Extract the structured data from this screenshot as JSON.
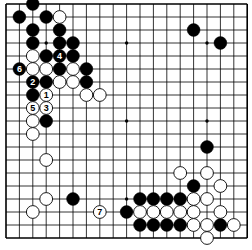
{
  "board": {
    "size": 19,
    "origin_x": 6,
    "origin_y": 4,
    "spacing_x": 13.4,
    "spacing_y": 13.0,
    "stone_radius": 6.4,
    "line_color": "#000000",
    "background": "#ffffff",
    "black_color": "#000000",
    "white_color": "#ffffff",
    "hoshi": [
      [
        3,
        3
      ],
      [
        9,
        3
      ],
      [
        15,
        3
      ],
      [
        3,
        9
      ],
      [
        9,
        9
      ],
      [
        15,
        9
      ],
      [
        3,
        15
      ],
      [
        9,
        15
      ],
      [
        15,
        15
      ]
    ]
  },
  "stones": {
    "black": [
      {
        "x": 2,
        "y": 0
      },
      {
        "x": 1,
        "y": 1
      },
      {
        "x": 3,
        "y": 1
      },
      {
        "x": 2,
        "y": 2
      },
      {
        "x": 4,
        "y": 2
      },
      {
        "x": 2,
        "y": 3
      },
      {
        "x": 4,
        "y": 3
      },
      {
        "x": 5,
        "y": 3
      },
      {
        "x": 3,
        "y": 4
      },
      {
        "x": 4,
        "y": 4,
        "label": "4"
      },
      {
        "x": 5,
        "y": 4
      },
      {
        "x": 1,
        "y": 5,
        "label": "6"
      },
      {
        "x": 4,
        "y": 5
      },
      {
        "x": 6,
        "y": 5
      },
      {
        "x": 2,
        "y": 6,
        "label": "2"
      },
      {
        "x": 3,
        "y": 6
      },
      {
        "x": 6,
        "y": 6
      },
      {
        "x": 2,
        "y": 7
      },
      {
        "x": 3,
        "y": 9
      },
      {
        "x": 14,
        "y": 2
      },
      {
        "x": 16,
        "y": 3
      },
      {
        "x": 15,
        "y": 11
      },
      {
        "x": 14,
        "y": 14
      },
      {
        "x": 5,
        "y": 15
      },
      {
        "x": 10,
        "y": 15
      },
      {
        "x": 11,
        "y": 15
      },
      {
        "x": 12,
        "y": 15
      },
      {
        "x": 13,
        "y": 15
      },
      {
        "x": 9,
        "y": 16
      },
      {
        "x": 10,
        "y": 17
      },
      {
        "x": 11,
        "y": 17
      },
      {
        "x": 12,
        "y": 17
      },
      {
        "x": 13,
        "y": 17
      },
      {
        "x": 16,
        "y": 17
      }
    ],
    "white": [
      {
        "x": 4,
        "y": 1
      },
      {
        "x": 2,
        "y": 4
      },
      {
        "x": 2,
        "y": 5
      },
      {
        "x": 3,
        "y": 5
      },
      {
        "x": 5,
        "y": 5
      },
      {
        "x": 4,
        "y": 6
      },
      {
        "x": 5,
        "y": 6
      },
      {
        "x": 3,
        "y": 7,
        "label": "1"
      },
      {
        "x": 6,
        "y": 7
      },
      {
        "x": 7,
        "y": 7
      },
      {
        "x": 2,
        "y": 8,
        "label": "5"
      },
      {
        "x": 3,
        "y": 8,
        "label": "3"
      },
      {
        "x": 2,
        "y": 9
      },
      {
        "x": 2,
        "y": 10
      },
      {
        "x": 3,
        "y": 12
      },
      {
        "x": 3,
        "y": 15
      },
      {
        "x": 2,
        "y": 16
      },
      {
        "x": 7,
        "y": 16,
        "label": "7"
      },
      {
        "x": 13,
        "y": 13
      },
      {
        "x": 15,
        "y": 13
      },
      {
        "x": 16,
        "y": 14
      },
      {
        "x": 14,
        "y": 15
      },
      {
        "x": 15,
        "y": 15
      },
      {
        "x": 10,
        "y": 16
      },
      {
        "x": 11,
        "y": 16
      },
      {
        "x": 12,
        "y": 16
      },
      {
        "x": 13,
        "y": 16
      },
      {
        "x": 14,
        "y": 16
      },
      {
        "x": 16,
        "y": 16
      },
      {
        "x": 14,
        "y": 17
      },
      {
        "x": 15,
        "y": 17
      },
      {
        "x": 17,
        "y": 17
      },
      {
        "x": 15,
        "y": 18
      }
    ]
  },
  "move_labels": [
    "1",
    "2",
    "3",
    "4",
    "5",
    "6",
    "7"
  ]
}
